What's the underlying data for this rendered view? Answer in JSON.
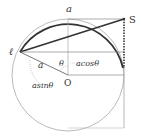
{
  "diagram": {
    "labels": {
      "top": "a",
      "point_s": "S",
      "point_l": "ℓ",
      "radius": "a",
      "angle": "θ",
      "center": "O",
      "horizontal": "acosθ",
      "vertical": "asinθ"
    },
    "caption": ""
  },
  "colors": {
    "bold_stroke": "#333333",
    "thin_stroke": "#9a9a9a",
    "text": "#333333"
  }
}
